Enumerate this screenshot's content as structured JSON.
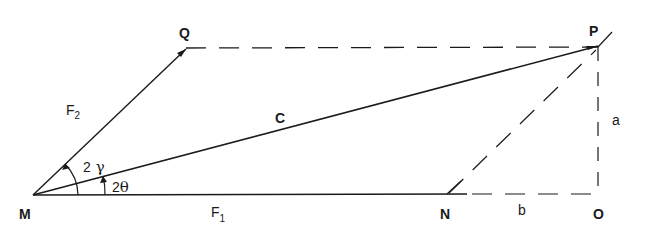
{
  "diagram": {
    "type": "vector-parallelogram",
    "points": {
      "M": {
        "label": "M"
      },
      "Q": {
        "label": "Q"
      },
      "P": {
        "label": "P"
      },
      "N": {
        "label": "N"
      },
      "O": {
        "label": "O"
      }
    },
    "vectors": {
      "F1": {
        "label": "F",
        "sub": "1"
      },
      "F2": {
        "label": "F",
        "sub": "2"
      },
      "C": {
        "label": "C"
      }
    },
    "angles": {
      "gamma": {
        "coef": "2",
        "symbol": "γ"
      },
      "theta": {
        "coef": "2",
        "symbol": "θ"
      }
    },
    "lengths": {
      "a": {
        "label": "a"
      },
      "b": {
        "label": "b"
      }
    },
    "colors": {
      "stroke": "#1a1a1a",
      "background": "#ffffff"
    }
  }
}
